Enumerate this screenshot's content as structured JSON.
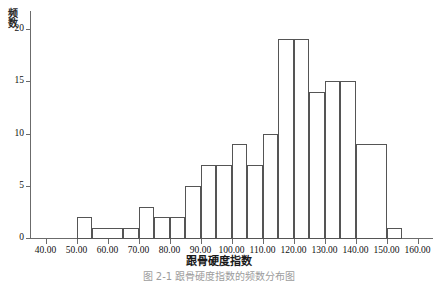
{
  "figure": {
    "caption": "图 2-1  跟骨硬度指数的频数分布图"
  },
  "chart_data": {
    "type": "bar",
    "title": "",
    "xlabel": "跟骨硬度指数",
    "ylabel": "频数",
    "bin_width": 5,
    "bin_starts": [
      50,
      55,
      60,
      65,
      70,
      75,
      80,
      85,
      90,
      95,
      100,
      105,
      110,
      115,
      120,
      125,
      130,
      135,
      140,
      145,
      150
    ],
    "categories": [
      "50-55",
      "55-60",
      "60-65",
      "65-70",
      "70-75",
      "75-80",
      "80-85",
      "85-90",
      "90-95",
      "95-100",
      "100-105",
      "105-110",
      "110-115",
      "115-120",
      "120-125",
      "125-130",
      "130-135",
      "135-140",
      "140-145",
      "145-150",
      "150-155"
    ],
    "values": [
      2,
      1,
      1,
      1,
      3,
      2,
      2,
      5,
      7,
      7,
      9,
      9,
      7,
      10,
      19,
      19,
      14,
      15,
      15,
      9,
      1
    ],
    "bars": [
      {
        "start": 50,
        "end": 55,
        "value": 2
      },
      {
        "start": 55,
        "end": 65,
        "value": 1
      },
      {
        "start": 65,
        "end": 70,
        "value": 1
      },
      {
        "start": 70,
        "end": 75,
        "value": 3
      },
      {
        "start": 75,
        "end": 80,
        "value": 2
      },
      {
        "start": 80,
        "end": 85,
        "value": 2
      },
      {
        "start": 85,
        "end": 90,
        "value": 5
      },
      {
        "start": 90,
        "end": 95,
        "value": 7
      },
      {
        "start": 95,
        "end": 100,
        "value": 7
      },
      {
        "start": 100,
        "end": 105,
        "value": 9
      },
      {
        "start": 105,
        "end": 110,
        "value": 7
      },
      {
        "start": 110,
        "end": 115,
        "value": 10
      },
      {
        "start": 115,
        "end": 120,
        "value": 19
      },
      {
        "start": 120,
        "end": 125,
        "value": 19
      },
      {
        "start": 125,
        "end": 130,
        "value": 14
      },
      {
        "start": 130,
        "end": 135,
        "value": 15
      },
      {
        "start": 135,
        "end": 140,
        "value": 15
      },
      {
        "start": 140,
        "end": 150,
        "value": 9
      },
      {
        "start": 150,
        "end": 155,
        "value": 1
      }
    ],
    "xlim": [
      35,
      165
    ],
    "ylim": [
      0,
      21
    ],
    "xticks": [
      40,
      50,
      60,
      70,
      80,
      90,
      100,
      110,
      120,
      130,
      140,
      150,
      160
    ],
    "xticklabels": [
      "40.00",
      "50.00",
      "60.00",
      "70.00",
      "80.00",
      "90.00",
      "100.00",
      "110.00",
      "120.00",
      "130.00",
      "140.00",
      "150.00",
      "160.00"
    ],
    "yticks": [
      0,
      5,
      10,
      15,
      20
    ],
    "yticklabels": [
      "0",
      "5",
      "10",
      "15",
      "20"
    ],
    "grid": false,
    "legend": null,
    "colors": {
      "bar_fill": "#ffffff",
      "bar_edge": "#555555",
      "axis": "#6b6b6b",
      "text": "#111111",
      "background": "#ffffff"
    }
  }
}
